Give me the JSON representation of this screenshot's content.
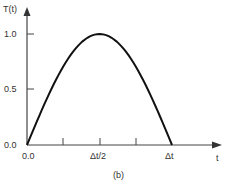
{
  "chart_data": {
    "type": "line",
    "title": "",
    "caption": "(b)",
    "xlabel": "t",
    "ylabel": "T(t)",
    "x_ticks": [
      "0.0",
      "",
      "Δt/2",
      "",
      "Δt"
    ],
    "y_ticks": [
      "0.0",
      "0.5",
      "1.0"
    ],
    "ylim": [
      0,
      1.0
    ],
    "xlim": [
      0,
      1
    ],
    "series": [
      {
        "name": "T(t)",
        "description": "Half-sine pulse from 0 to Δt, peak 1.0 at Δt/2",
        "x": [
          0.0,
          0.125,
          0.25,
          0.375,
          0.5,
          0.625,
          0.75,
          0.875,
          1.0
        ],
        "values": [
          0.0,
          0.383,
          0.707,
          0.924,
          1.0,
          0.924,
          0.707,
          0.383,
          0.0
        ]
      }
    ],
    "grid": false,
    "legend": "none"
  },
  "labels": {
    "y_axis": "T(t)",
    "x_axis": "t",
    "y_1": "1.0",
    "y_05": "0.5",
    "y_0": "0.0",
    "x_0": "0.0",
    "x_half": "Δt/2",
    "x_full": "Δt",
    "caption": "(b)"
  },
  "colors": {
    "axis": "#444444",
    "curve": "#111111",
    "text": "#333333"
  }
}
